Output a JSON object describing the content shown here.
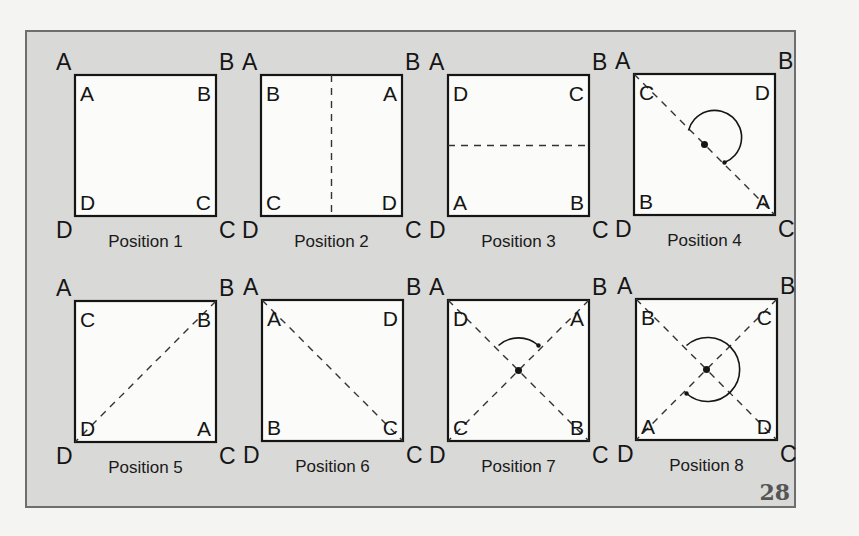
{
  "page_number": "28",
  "colors": {
    "panel": "#d9d9d7",
    "square": "#fbfbf9",
    "ink": "#151515",
    "frame": "#6e6e6e"
  },
  "positions": [
    {
      "caption": "Position 1",
      "outer": [
        "A",
        "B",
        "C",
        "D"
      ],
      "inner": [
        "A",
        "B",
        "C",
        "D"
      ],
      "axes": [],
      "rotation": "none"
    },
    {
      "caption": "Position 2",
      "outer": [
        "A",
        "B",
        "C",
        "D"
      ],
      "inner": [
        "B",
        "A",
        "D",
        "C"
      ],
      "axes": [
        "vertical"
      ],
      "rotation": "none"
    },
    {
      "caption": "Position 3",
      "outer": [
        "A",
        "B",
        "C",
        "D"
      ],
      "inner": [
        "D",
        "C",
        "B",
        "A"
      ],
      "axes": [
        "horizontal"
      ],
      "rotation": "none"
    },
    {
      "caption": "Position 4",
      "outer": [
        "A",
        "B",
        "C",
        "D"
      ],
      "inner": [
        "C",
        "D",
        "A",
        "B"
      ],
      "axes": [
        "diagonal-AC"
      ],
      "rotation": "180"
    },
    {
      "caption": "Position 5",
      "outer": [
        "A",
        "B",
        "C",
        "D"
      ],
      "inner": [
        "C",
        "B",
        "A",
        "D"
      ],
      "axes": [
        "diagonal-BD"
      ],
      "rotation": "none"
    },
    {
      "caption": "Position 6",
      "outer": [
        "A",
        "B",
        "C",
        "D"
      ],
      "inner": [
        "A",
        "D",
        "C",
        "B"
      ],
      "axes": [
        "diagonal-AC"
      ],
      "rotation": "none"
    },
    {
      "caption": "Position 7",
      "outer": [
        "A",
        "B",
        "C",
        "D"
      ],
      "inner": [
        "D",
        "A",
        "B",
        "C"
      ],
      "axes": [
        "diagonal-AC",
        "diagonal-BD"
      ],
      "rotation": "90"
    },
    {
      "caption": "Position 8",
      "outer": [
        "A",
        "B",
        "C",
        "D"
      ],
      "inner": [
        "B",
        "C",
        "D",
        "A"
      ],
      "axes": [
        "diagonal-AC",
        "diagonal-BD"
      ],
      "rotation": "270"
    }
  ]
}
